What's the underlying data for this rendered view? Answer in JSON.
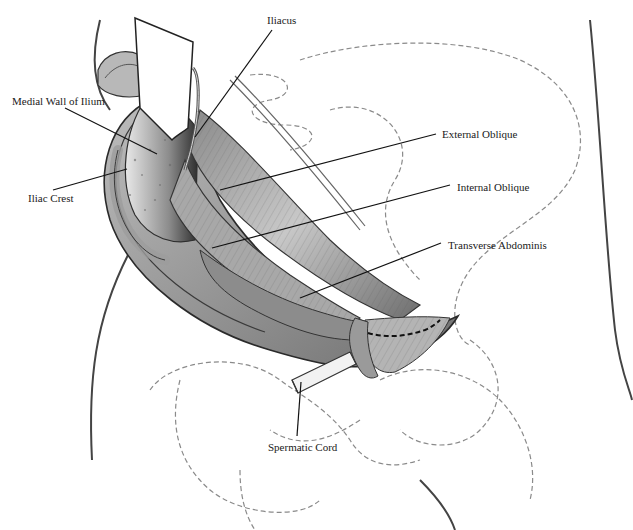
{
  "figure": {
    "colors": {
      "background": "#ffffff",
      "ink": "#1a1a1a",
      "tissue_dark": "#555555",
      "tissue_mid": "#9a9a9a",
      "tissue_light": "#d6d6d6",
      "dashed_outline": "#8a8a8a"
    }
  },
  "labels": [
    {
      "id": "iliacus",
      "text": "Iliacus",
      "x": 267,
      "y": 14,
      "line": [
        [
          272,
          30
        ],
        [
          195,
          137
        ]
      ]
    },
    {
      "id": "medial-wall-ilium",
      "text": "Medial Wall of Ilium",
      "x": 12,
      "y": 95,
      "line": [
        [
          65,
          108
        ],
        [
          157,
          154
        ]
      ]
    },
    {
      "id": "iliac-crest",
      "text": "Iliac Crest",
      "x": 28,
      "y": 192,
      "line": [
        [
          53,
          190
        ],
        [
          127,
          169
        ]
      ]
    },
    {
      "id": "external-oblique",
      "text": "External Oblique",
      "x": 442,
      "y": 128,
      "line": [
        [
          436,
          134
        ],
        [
          220,
          190
        ]
      ]
    },
    {
      "id": "internal-oblique",
      "text": "Internal Oblique",
      "x": 457,
      "y": 181,
      "line": [
        [
          450,
          185
        ],
        [
          212,
          248
        ]
      ]
    },
    {
      "id": "transverse-abdominis",
      "text": "Transverse Abdominis",
      "x": 448,
      "y": 239,
      "line": [
        [
          441,
          243
        ],
        [
          300,
          298
        ]
      ]
    },
    {
      "id": "spermatic-cord",
      "text": "Spermatic Cord",
      "x": 268,
      "y": 441,
      "line": [
        [
          297,
          436
        ],
        [
          301,
          382
        ]
      ]
    }
  ]
}
